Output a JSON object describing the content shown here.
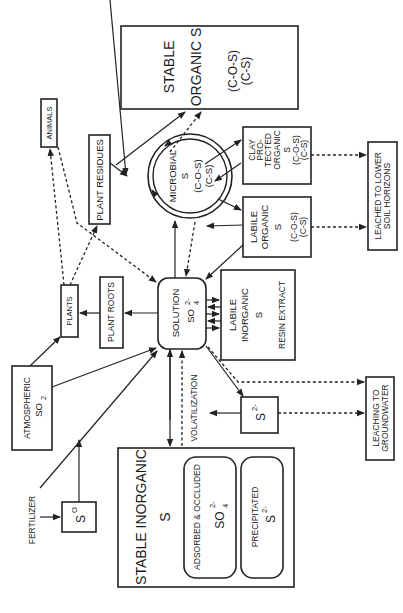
{
  "nodes": {
    "stable_organic": {
      "line1": "STABLE",
      "line2": "ORGANIC S",
      "line3": "(C-O-S)",
      "line4": "(C-S)"
    },
    "animals": {
      "label": "ANIMALS"
    },
    "plant_residues": {
      "label": "PLANT RESIDUES"
    },
    "microbial": {
      "line1": "MICROBIAL",
      "line2": "S",
      "line3": "(C-O-S)",
      "line4": "(C-S)"
    },
    "clay_protected": {
      "line1": "CLAY",
      "line2": "PRO-",
      "line3": "TECTED",
      "line4": "ORGANIC",
      "line5": "S",
      "line6": "(C-O-S)",
      "line7": "(C-S)"
    },
    "labile_organic": {
      "line1": "LABILE",
      "line2": "ORGANIC",
      "line3": "S",
      "line4": "(C-O-S)",
      "line5": "(C-S)"
    },
    "leached_lower": {
      "line1": "LEACHED TO LOWER",
      "line2": "SOIL HORIZONS"
    },
    "plants": {
      "label": "PLANTS"
    },
    "plant_roots": {
      "label": "PLANT ROOTS"
    },
    "solution": {
      "line1": "SOLUTION",
      "ion": "SO",
      "sup": "2-",
      "sub": "4"
    },
    "labile_inorganic": {
      "line1": "LABILE",
      "line2": "INORGANIC",
      "line3": "S",
      "line4": "RESIN EXTRACT"
    },
    "atmospheric": {
      "line1": "ATMOSPHERIC",
      "ion": "SO",
      "sub": "2"
    },
    "sulfide": {
      "ion": "S",
      "sup": "2-"
    },
    "leaching_groundwater": {
      "line1": "LEACHING  TO",
      "line2": "GROUNDWATER"
    },
    "volatilization": {
      "label": "VOLATILIZATION"
    },
    "fertilizer": {
      "label": "FERTILIZER"
    },
    "elemental_s": {
      "ion": "S",
      "sup": "O"
    },
    "stable_inorganic": {
      "line1": "STABLE INORGANIC",
      "line2": "S",
      "adsorbed": {
        "label": "ADSORBED & OCCLUDED",
        "ion": "SO",
        "sup": "2-",
        "sub": "4"
      },
      "precipitated": {
        "label": "PRECIPITATED",
        "ion": "S",
        "sup": "2-"
      }
    }
  }
}
